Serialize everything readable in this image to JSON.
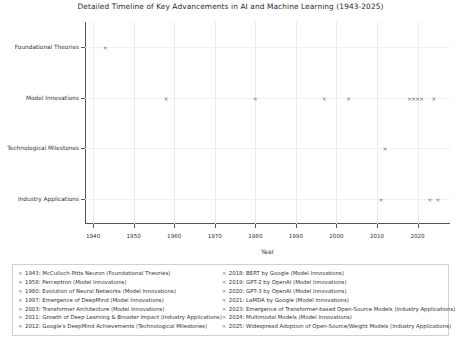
{
  "chart_data": {
    "type": "scatter",
    "title": "Detailed Timeline of Key Advancements in AI and Machine Learning (1943-2025)",
    "xlabel": "Year",
    "ylabel": "",
    "xlim": [
      1938,
      2028
    ],
    "xticks": [
      1940,
      1950,
      1960,
      1970,
      1980,
      1990,
      2000,
      2010,
      2020
    ],
    "xticklabels": [
      "1940",
      "1950",
      "1960",
      "1970",
      "1980",
      "1990",
      "2000",
      "2010",
      "2020"
    ],
    "categories": [
      "Foundational Theories",
      "Model Innovations",
      "Technological Milestones",
      "Industry Applications"
    ],
    "grid": true,
    "legend_position": "below-axes",
    "marker": "x",
    "marker_color": "#6f6f6f",
    "points": [
      {
        "year": 1943,
        "category": "Foundational Theories",
        "label": "1943: McCulloch-Pitts Neuron (Foundational Theories)"
      },
      {
        "year": 1958,
        "category": "Model Innovations",
        "label": "1958: Perceptron (Model Innovations)"
      },
      {
        "year": 1980,
        "category": "Model Innovations",
        "label": "1980: Evolution of Neural Networks (Model Innovations)"
      },
      {
        "year": 1997,
        "category": "Model Innovations",
        "label": "1997: Emergence of DeepMind (Model Innovations)"
      },
      {
        "year": 2003,
        "category": "Model Innovations",
        "label": "2003: Transformer Architecture (Model Innovations)"
      },
      {
        "year": 2011,
        "category": "Industry Applications",
        "label": "2011: Growth of Deep Learning & Broader Impact (Industry Applications)"
      },
      {
        "year": 2012,
        "category": "Technological Milestones",
        "label": "2012: Google's DeepMind Achievements (Technological Milestones)"
      },
      {
        "year": 2018,
        "category": "Model Innovations",
        "label": "2018: BERT by Google (Model Innovations)"
      },
      {
        "year": 2019,
        "category": "Model Innovations",
        "label": "2019: GPT-2 by OpenAI (Model Innovations)"
      },
      {
        "year": 2020,
        "category": "Model Innovations",
        "label": "2020: GPT-3 by OpenAI (Model Innovations)"
      },
      {
        "year": 2021,
        "category": "Model Innovations",
        "label": "2021: LaMDA by Google (Model Innovations)"
      },
      {
        "year": 2023,
        "category": "Industry Applications",
        "label": "2023: Emergence of Transformer-based Open-Source Models (Industry Applications)"
      },
      {
        "year": 2024,
        "category": "Model Innovations",
        "label": "2024: Multimodal Models (Model Innovations)"
      },
      {
        "year": 2025,
        "category": "Industry Applications",
        "label": "2025: Widespread Adoption of Open-Source/Weight Models (Industry Applications)"
      }
    ],
    "legend_entries_left": [
      "1943: McCulloch-Pitts Neuron (Foundational Theories)",
      "1958: Perceptron (Model Innovations)",
      "1980: Evolution of Neural Networks (Model Innovations)",
      "1997: Emergence of DeepMind (Model Innovations)",
      "2003: Transformer Architecture (Model Innovations)",
      "2011: Growth of Deep Learning & Broader Impact (Industry Applications)",
      "2012: Google's DeepMind Achievements (Technological Milestones)"
    ],
    "legend_entries_right": [
      "2018: BERT by Google (Model Innovations)",
      "2019: GPT-2 by OpenAI (Model Innovations)",
      "2020: GPT-3 by OpenAI (Model Innovations)",
      "2021: LaMDA by Google (Model Innovations)",
      "2023: Emergence of Transformer-based Open-Source Models (Industry Applications)",
      "2024: Multimodal Models (Model Innovations)",
      "2025: Widespread Adoption of Open-Source/Weight Models (Industry Applications)"
    ]
  }
}
